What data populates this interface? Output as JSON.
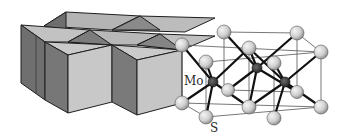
{
  "figure": {
    "labels": {
      "mo": "Mo",
      "s": "S"
    },
    "colors": {
      "background": "#ffffff",
      "prism_top": "#bdbdbd",
      "prism_light_face": "#c8c8c8",
      "prism_dark_face": "#7a7a7a",
      "edge": "#1e1e1e",
      "s_atom": "#d6d6d6",
      "mo_atom": "#3a3a3a",
      "bond": "#111111",
      "cell_line": "#555555"
    }
  }
}
